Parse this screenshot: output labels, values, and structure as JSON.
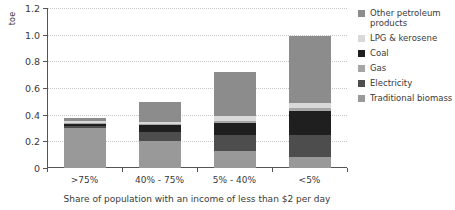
{
  "chart_data": {
    "type": "bar",
    "subtype": "stacked-bar",
    "title": "",
    "xlabel": "Share of population with an income of less than $2 per day",
    "ylabel": "toe",
    "categories": [
      ">75%",
      "40% - 75%",
      "5% - 40%",
      "<5%"
    ],
    "ylim": [
      0,
      1.2
    ],
    "yticks": [
      0,
      0.2,
      0.4,
      0.6,
      0.8,
      1.0,
      1.2
    ],
    "ytick_labels": [
      "0",
      "0.2",
      "0.4",
      "0.6",
      "0.8",
      "1.0",
      "1.2"
    ],
    "grid": true,
    "legend_position": "right",
    "stack_order_bottom_to_top": [
      "Traditional biomass",
      "Electricity",
      "Coal",
      "Gas",
      "LPG & kerosene",
      "Other petroleum products"
    ],
    "series": [
      {
        "name": "Other petroleum products",
        "color": "#8c8c8c",
        "values": [
          0.025,
          0.15,
          0.33,
          0.5
        ]
      },
      {
        "name": "LPG & kerosene",
        "color": "#d9d9d9",
        "values": [
          0.01,
          0.012,
          0.04,
          0.04
        ]
      },
      {
        "name": "Coal",
        "color": "#1f1f1f",
        "values": [
          0.02,
          0.055,
          0.085,
          0.175
        ]
      },
      {
        "name": "Gas",
        "color": "#a6a6a6",
        "values": [
          0.005,
          0.005,
          0.015,
          0.025
        ]
      },
      {
        "name": "Electricity",
        "color": "#4d4d4d",
        "values": [
          0.015,
          0.07,
          0.12,
          0.165
        ]
      },
      {
        "name": "Traditional biomass",
        "color": "#999999",
        "values": [
          0.3,
          0.2,
          0.13,
          0.085
        ]
      }
    ],
    "totals": [
      0.375,
      0.492,
      0.72,
      0.99
    ]
  },
  "legend": {
    "items": [
      {
        "label": "Other petroleum products",
        "color": "#8c8c8c"
      },
      {
        "label": "LPG & kerosene",
        "color": "#d9d9d9"
      },
      {
        "label": "Coal",
        "color": "#1f1f1f"
      },
      {
        "label": "Gas",
        "color": "#a6a6a6"
      },
      {
        "label": "Electricity",
        "color": "#4d4d4d"
      },
      {
        "label": "Traditional biomass",
        "color": "#999999"
      }
    ]
  },
  "axes": {
    "y_title": "toe",
    "x_title": "Share of population with an income of less than $2 per day"
  }
}
